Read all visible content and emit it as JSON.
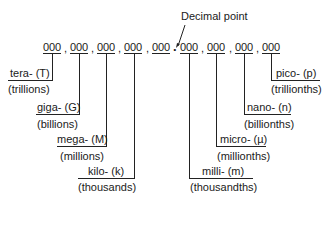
{
  "title_annotation": "Decimal point",
  "number": {
    "groups": [
      "000",
      "000",
      "000",
      "000",
      "000",
      "000",
      "000",
      "000",
      "000"
    ],
    "comma": ",",
    "decimal": "."
  },
  "prefixes": {
    "tera": {
      "label": "tera- (T)",
      "meaning": "(trillions)"
    },
    "giga": {
      "label": "giga- (G)",
      "meaning": "(billions)"
    },
    "mega": {
      "label": "mega- (M)",
      "meaning": "(millions)"
    },
    "kilo": {
      "label": "kilo- (k)",
      "meaning": "(thousands)"
    },
    "milli": {
      "label": "milli- (m)",
      "meaning": "(thousandths)"
    },
    "micro": {
      "label": "micro- (µ)",
      "meaning": "(millionths)"
    },
    "nano": {
      "label": "nano- (n)",
      "meaning": "(billionths)"
    },
    "pico": {
      "label": "pico- (p)",
      "meaning": "(trillionths)"
    }
  }
}
